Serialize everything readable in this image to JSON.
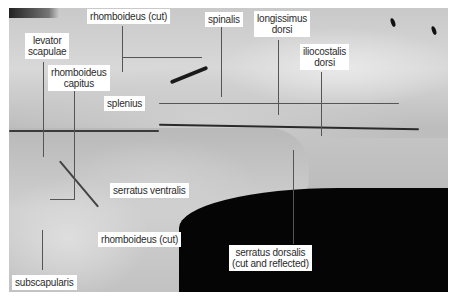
{
  "figure": {
    "labels": [
      {
        "id": "rhomboideus-cut-top",
        "text": "rhomboideus (cut)"
      },
      {
        "id": "spinalis",
        "text": "spinalis"
      },
      {
        "id": "longissimus-dorsi",
        "line1": "longissimus",
        "line2": "dorsi"
      },
      {
        "id": "iliocostalis-dorsi",
        "line1": "iliocostalis",
        "line2": "dorsi"
      },
      {
        "id": "levator-scapulae",
        "line1": "levator",
        "line2": "scapulae"
      },
      {
        "id": "rhomboideus-capitus",
        "line1": "rhomboideus",
        "line2": "capitus"
      },
      {
        "id": "splenius",
        "text": "splenius"
      },
      {
        "id": "serratus-ventralis",
        "text": "serratus ventralis"
      },
      {
        "id": "rhomboideus-cut-bottom",
        "text": "rhomboideus (cut)"
      },
      {
        "id": "serratus-dorsalis",
        "line1": "serratus dorsalis",
        "line2": "(cut and reflected)"
      },
      {
        "id": "subscapularis",
        "text": "subscapularis"
      }
    ]
  }
}
